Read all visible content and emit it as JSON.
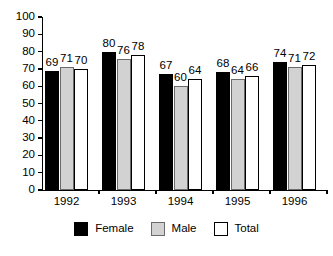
{
  "chart_data": {
    "type": "bar",
    "title": "",
    "subtitle": "",
    "xlabel": "",
    "ylabel": "",
    "categories": [
      "1992",
      "1993",
      "1994",
      "1995",
      "1996"
    ],
    "series": [
      {
        "name": "Female",
        "color": "#000000",
        "values": [
          69,
          80,
          67,
          68,
          74
        ]
      },
      {
        "name": "Male",
        "color": "#d2d2d2",
        "values": [
          71,
          76,
          60,
          64,
          71
        ]
      },
      {
        "name": "Total",
        "color": "#ffffff",
        "values": [
          70,
          78,
          64,
          66,
          72
        ]
      }
    ],
    "ylim": [
      0,
      100
    ],
    "yticks": [
      0,
      10,
      20,
      30,
      40,
      50,
      60,
      70,
      80,
      90,
      100
    ],
    "ytick_labels": [
      "0",
      "10",
      "20",
      "30",
      "40",
      "50",
      "60",
      "70",
      "80",
      "90",
      "100"
    ],
    "grid": false,
    "data_labels": true,
    "legend_position": "bottom-center",
    "legend": [
      "Female",
      "Male",
      "Total"
    ]
  }
}
